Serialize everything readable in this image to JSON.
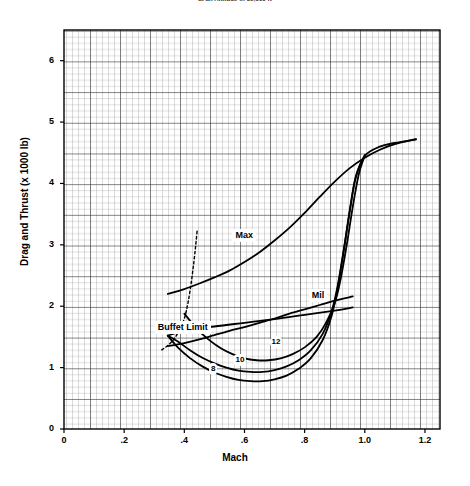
{
  "chart_data": {
    "type": "line",
    "title": "at an Altitude of 35,000 ft",
    "xlabel": "Mach",
    "ylabel": "Drag and Thrust (x 1000 lb)",
    "xlim": [
      0,
      1.25
    ],
    "ylim": [
      0,
      6.5
    ],
    "xticks": [
      "0",
      ".2",
      ".4",
      ".6",
      ".8",
      "1.0",
      "1.2"
    ],
    "xtick_values": [
      0,
      0.2,
      0.4,
      0.6,
      0.8,
      1.0,
      1.2
    ],
    "yticks": [
      "0",
      "1",
      "2",
      "3",
      "4",
      "5",
      "6"
    ],
    "ytick_values": [
      0,
      1,
      2,
      3,
      4,
      5,
      6
    ],
    "grid": "fine graph-paper grid, minor every 0.01 Mach / 0.05 klb, major every 0.05 Mach / 0.25 klb",
    "legend": "inline curve labels",
    "series": [
      {
        "name": "Max",
        "label": "Max",
        "label_x": 0.6,
        "label_y": 3.15,
        "points": [
          [
            0.345,
            2.2
          ],
          [
            0.4,
            2.28
          ],
          [
            0.45,
            2.37
          ],
          [
            0.5,
            2.47
          ],
          [
            0.55,
            2.58
          ],
          [
            0.6,
            2.72
          ],
          [
            0.65,
            2.88
          ],
          [
            0.7,
            3.07
          ],
          [
            0.75,
            3.28
          ],
          [
            0.8,
            3.52
          ],
          [
            0.85,
            3.78
          ],
          [
            0.9,
            4.03
          ],
          [
            0.95,
            4.25
          ],
          [
            1.0,
            4.42
          ],
          [
            1.05,
            4.55
          ],
          [
            1.1,
            4.64
          ],
          [
            1.17,
            4.72
          ]
        ]
      },
      {
        "name": "Mil",
        "label": "Mil",
        "label_x": 0.845,
        "label_y": 2.17,
        "points": [
          [
            0.345,
            1.35
          ],
          [
            0.4,
            1.4
          ],
          [
            0.45,
            1.46
          ],
          [
            0.5,
            1.53
          ],
          [
            0.55,
            1.6
          ],
          [
            0.6,
            1.66
          ],
          [
            0.65,
            1.73
          ],
          [
            0.7,
            1.8
          ],
          [
            0.75,
            1.88
          ],
          [
            0.8,
            1.95
          ],
          [
            0.85,
            2.02
          ],
          [
            0.9,
            2.09
          ],
          [
            0.96,
            2.16
          ]
        ]
      },
      {
        "name": "8",
        "label": "8",
        "label_x": 0.495,
        "label_y": 0.98,
        "weight_klb": 8,
        "points": [
          [
            0.345,
            1.52
          ],
          [
            0.38,
            1.32
          ],
          [
            0.42,
            1.15
          ],
          [
            0.46,
            1.02
          ],
          [
            0.5,
            0.92
          ],
          [
            0.54,
            0.85
          ],
          [
            0.58,
            0.8
          ],
          [
            0.62,
            0.78
          ],
          [
            0.66,
            0.78
          ],
          [
            0.7,
            0.81
          ],
          [
            0.74,
            0.87
          ],
          [
            0.78,
            0.98
          ],
          [
            0.82,
            1.15
          ],
          [
            0.86,
            1.45
          ],
          [
            0.89,
            1.85
          ],
          [
            0.91,
            2.3
          ],
          [
            0.93,
            2.9
          ],
          [
            0.95,
            3.55
          ],
          [
            0.97,
            4.1
          ],
          [
            1.0,
            4.45
          ],
          [
            1.05,
            4.6
          ],
          [
            1.1,
            4.66
          ],
          [
            1.17,
            4.72
          ]
        ]
      },
      {
        "name": "10",
        "label": "10",
        "label_x": 0.585,
        "label_y": 1.12,
        "weight_klb": 10,
        "points": [
          [
            0.345,
            1.52
          ],
          [
            0.38,
            1.42
          ],
          [
            0.42,
            1.28
          ],
          [
            0.46,
            1.16
          ],
          [
            0.5,
            1.07
          ],
          [
            0.54,
            1.0
          ],
          [
            0.58,
            0.95
          ],
          [
            0.62,
            0.93
          ],
          [
            0.66,
            0.93
          ],
          [
            0.7,
            0.96
          ],
          [
            0.74,
            1.02
          ],
          [
            0.78,
            1.12
          ],
          [
            0.82,
            1.28
          ],
          [
            0.86,
            1.55
          ],
          [
            0.89,
            1.92
          ],
          [
            0.91,
            2.34
          ],
          [
            0.93,
            2.92
          ],
          [
            0.95,
            3.56
          ],
          [
            0.97,
            4.11
          ],
          [
            1.0,
            4.46
          ]
        ]
      },
      {
        "name": "12",
        "label": "12",
        "label_x": 0.705,
        "label_y": 1.42,
        "weight_klb": 12,
        "points": [
          [
            0.4,
            1.88
          ],
          [
            0.44,
            1.64
          ],
          [
            0.48,
            1.46
          ],
          [
            0.52,
            1.32
          ],
          [
            0.56,
            1.22
          ],
          [
            0.6,
            1.15
          ],
          [
            0.64,
            1.12
          ],
          [
            0.68,
            1.12
          ],
          [
            0.72,
            1.15
          ],
          [
            0.76,
            1.22
          ],
          [
            0.8,
            1.33
          ],
          [
            0.84,
            1.5
          ],
          [
            0.87,
            1.72
          ],
          [
            0.9,
            2.05
          ],
          [
            0.92,
            2.45
          ],
          [
            0.94,
            3.0
          ],
          [
            0.96,
            3.62
          ],
          [
            0.98,
            4.15
          ],
          [
            1.0,
            4.46
          ]
        ]
      },
      {
        "name": "Buffet Limit",
        "label": "Buffet Limit",
        "label_x": 0.395,
        "label_y": 1.66,
        "style": "dashed",
        "points": [
          [
            0.325,
            1.29
          ],
          [
            0.345,
            1.36
          ],
          [
            0.365,
            1.46
          ],
          [
            0.385,
            1.62
          ],
          [
            0.4,
            1.8
          ],
          [
            0.412,
            2.05
          ],
          [
            0.422,
            2.35
          ],
          [
            0.43,
            2.65
          ],
          [
            0.437,
            2.95
          ],
          [
            0.443,
            3.25
          ]
        ]
      },
      {
        "name": "Buffet Limit tie line",
        "style": "solid",
        "points": [
          [
            0.345,
            1.52
          ],
          [
            0.4,
            1.6
          ],
          [
            0.5,
            1.67
          ],
          [
            0.6,
            1.73
          ],
          [
            0.7,
            1.79
          ],
          [
            0.8,
            1.86
          ],
          [
            0.9,
            1.93
          ],
          [
            0.96,
            1.98
          ]
        ]
      }
    ]
  }
}
